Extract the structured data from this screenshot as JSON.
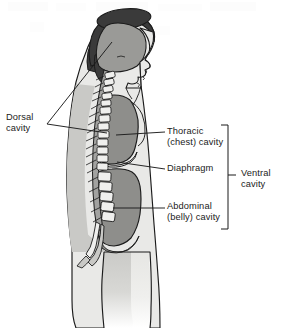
{
  "figure": {
    "labels": {
      "dorsal_cavity_line1": "Dorsal",
      "dorsal_cavity_line2": "cavity",
      "thoracic_cavity_line1": "Thoracic",
      "thoracic_cavity_line2": "(chest) cavity",
      "diaphragm": "Diaphragm",
      "abdominal_cavity_line1": "Abdominal",
      "abdominal_cavity_line2": "(belly) cavity",
      "ventral_cavity_line1": "Ventral",
      "ventral_cavity_line2": "cavity"
    },
    "colors": {
      "background": "#ffffff",
      "outline": "#1b1b1b",
      "text": "#1b1b1b",
      "hair_dark": "#3a3a3a",
      "body_light": "#e9e9e7",
      "body_mid": "#c9c9c6",
      "cavity_gray": "#8e8e8b",
      "skull_cavity": "#9a9a97",
      "vertebra_fill": "#efefed",
      "spinal_canal": "#a2a2a0",
      "leader_line": "#1b1b1b"
    },
    "leader_lines": {
      "dorsal_fan_vertex": "47,124",
      "dorsal_to_cranial_cavity": "112,42",
      "dorsal_to_spinal_canal": "107,133",
      "thoracic_line": "116,135 to 165,132",
      "diaphragm_line": "117,163 to 165,169",
      "abdominal_line": "113,208 to 165,208"
    },
    "bracket": {
      "x": "228",
      "top": "125",
      "bottom": "229",
      "tick_y": "175",
      "arm_length": "7"
    }
  }
}
